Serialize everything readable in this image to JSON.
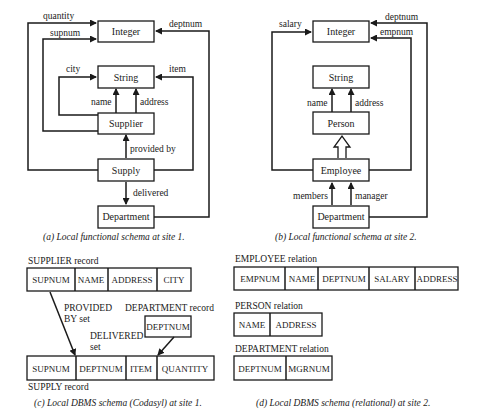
{
  "panel_a": {
    "caption": "(a)  Local functional schema at site 1.",
    "nodes": {
      "integer": "Integer",
      "string": "String",
      "supplier": "Supplier",
      "supply": "Supply",
      "department": "Department"
    },
    "edges": {
      "quantity": "quantity",
      "supnum": "supnum",
      "deptnum": "deptnum",
      "city": "city",
      "item": "item",
      "name": "name",
      "address": "address",
      "provided_by": "provided by",
      "delivered": "delivered"
    }
  },
  "panel_b": {
    "caption": "(b)  Local functional schema at site 2.",
    "nodes": {
      "integer": "Integer",
      "string": "String",
      "person": "Person",
      "employee": "Employee",
      "department": "Department"
    },
    "edges": {
      "salary": "salary",
      "deptnum": "deptnum",
      "empnum": "empnum",
      "name": "name",
      "address": "address",
      "members": "members",
      "manager": "manager"
    }
  },
  "panel_c": {
    "caption": "(c)  Local DBMS schema (Codasyl) at site 1.",
    "supplier_record": {
      "label": "SUPPLIER record",
      "fields": [
        "SUPNUM",
        "NAME",
        "ADDRESS",
        "CITY"
      ]
    },
    "department_record": {
      "label": "DEPARTMENT record",
      "fields": [
        "DEPTNUM"
      ]
    },
    "supply_record": {
      "label": "SUPPLY record",
      "fields": [
        "SUPNUM",
        "DEPTNUM",
        "ITEM",
        "QUANTITY"
      ]
    },
    "provided_by_set": {
      "line1": "PROVIDED",
      "line2": "BY set"
    },
    "delivered_set": {
      "line1": "DELIVERED",
      "line2": "set"
    }
  },
  "panel_d": {
    "caption": "(d)  Local DBMS schema (relational) at site 2.",
    "employee_relation": {
      "label": "EMPLOYEE relation",
      "fields": [
        "EMPNUM",
        "NAME",
        "DEPTNUM",
        "SALARY",
        "ADDRESS"
      ]
    },
    "person_relation": {
      "label": "PERSON relation",
      "fields": [
        "NAME",
        "ADDRESS"
      ]
    },
    "department_relation": {
      "label": "DEPARTMENT relation",
      "fields": [
        "DEPTNUM",
        "MGRNUM"
      ]
    }
  }
}
